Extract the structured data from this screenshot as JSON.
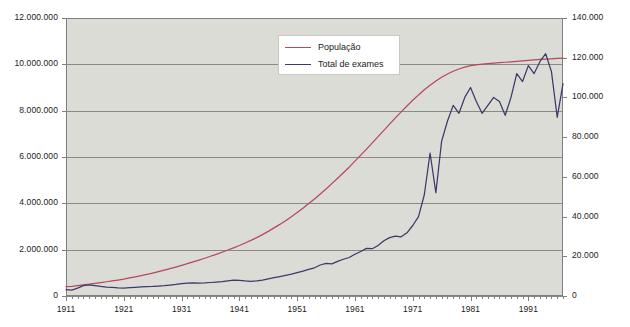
{
  "chart_data": {
    "type": "line",
    "title": "",
    "subtitle": "",
    "xlabel": "",
    "ylabel": "",
    "ylabel_right": "",
    "grid": true,
    "legend_position": "top-center",
    "background_plot_color": "#dcdcd6",
    "background_page_color": "#ffffff",
    "axis_color": "#808080",
    "gridline_color": "#8a8a84",
    "x": [
      1911,
      1912,
      1913,
      1914,
      1915,
      1916,
      1917,
      1918,
      1919,
      1920,
      1921,
      1922,
      1923,
      1924,
      1925,
      1926,
      1927,
      1928,
      1929,
      1930,
      1931,
      1932,
      1933,
      1934,
      1935,
      1936,
      1937,
      1938,
      1939,
      1940,
      1941,
      1942,
      1943,
      1944,
      1945,
      1946,
      1947,
      1948,
      1949,
      1950,
      1951,
      1952,
      1953,
      1954,
      1955,
      1956,
      1957,
      1958,
      1959,
      1960,
      1961,
      1962,
      1963,
      1964,
      1965,
      1966,
      1967,
      1968,
      1969,
      1970,
      1971,
      1972,
      1973,
      1974,
      1975,
      1976,
      1977,
      1978,
      1979,
      1980,
      1981,
      1982,
      1983,
      1984,
      1985,
      1986,
      1987,
      1988,
      1989,
      1990,
      1991,
      1992,
      1993,
      1994,
      1995,
      1996,
      1997
    ],
    "xlim": [
      1911,
      1997
    ],
    "xticks": [
      1911,
      1921,
      1931,
      1941,
      1951,
      1961,
      1971,
      1981,
      1991
    ],
    "xtick_labels": [
      "1911",
      "1921",
      "1931",
      "1941",
      "1951",
      "1961",
      "1971",
      "1981",
      "1991"
    ],
    "x_minor_ticks_every": 1,
    "yticks_left": [
      0,
      2000000,
      4000000,
      6000000,
      8000000,
      10000000,
      12000000
    ],
    "ytick_labels_left": [
      "0",
      "2.000.000",
      "4.000.000",
      "6.000.000",
      "8.000.000",
      "10.000.000",
      "12.000.000"
    ],
    "ylim_left": [
      0,
      12000000
    ],
    "yticks_right": [
      0,
      20000,
      40000,
      60000,
      80000,
      100000,
      120000,
      140000
    ],
    "ytick_labels_right": [
      "0",
      "20.000",
      "40.000",
      "60.000",
      "80.000",
      "100.000",
      "120.000",
      "140.000"
    ],
    "ylim_right": [
      0,
      140000
    ],
    "series": [
      {
        "name": "População",
        "label": "População",
        "axis": "left",
        "color": "#b5485c",
        "values": [
          400000,
          420000,
          450000,
          480000,
          510000,
          545000,
          580000,
          615000,
          650000,
          690000,
          730000,
          780000,
          830000,
          880000,
          935000,
          990000,
          1050000,
          1115000,
          1180000,
          1250000,
          1320000,
          1395000,
          1470000,
          1550000,
          1630000,
          1715000,
          1800000,
          1890000,
          1985000,
          2080000,
          2180000,
          2290000,
          2400000,
          2520000,
          2650000,
          2790000,
          2940000,
          3090000,
          3250000,
          3420000,
          3600000,
          3790000,
          3990000,
          4190000,
          4400000,
          4620000,
          4850000,
          5080000,
          5320000,
          5560000,
          5820000,
          6080000,
          6340000,
          6610000,
          6880000,
          7150000,
          7420000,
          7690000,
          7950000,
          8200000,
          8450000,
          8680000,
          8900000,
          9100000,
          9280000,
          9440000,
          9580000,
          9700000,
          9800000,
          9880000,
          9940000,
          9980000,
          10010000,
          10030000,
          10050000,
          10070000,
          10090000,
          10110000,
          10130000,
          10150000,
          10170000,
          10190000,
          10210000,
          10225000,
          10240000,
          10255000,
          10270000
        ]
      },
      {
        "name": "Total de exames",
        "label": "Total de exames",
        "axis": "right",
        "color": "#3a3a6b",
        "values": [
          3200,
          3000,
          4000,
          5200,
          5600,
          5200,
          4800,
          4500,
          4300,
          4100,
          4000,
          4200,
          4400,
          4600,
          4700,
          4800,
          5000,
          5200,
          5500,
          5800,
          6200,
          6500,
          6600,
          6500,
          6600,
          6800,
          7000,
          7200,
          7600,
          8000,
          7900,
          7600,
          7400,
          7600,
          8000,
          8600,
          9200,
          9800,
          10400,
          11000,
          11800,
          12500,
          13400,
          14200,
          15600,
          16400,
          16200,
          17400,
          18500,
          19400,
          21000,
          22400,
          24000,
          23800,
          25400,
          27800,
          29400,
          30200,
          29800,
          31800,
          35500,
          40000,
          51000,
          72000,
          52000,
          78000,
          88000,
          96000,
          92000,
          100000,
          105000,
          98000,
          92000,
          96000,
          100000,
          98000,
          91000,
          100000,
          112000,
          108000,
          116000,
          112000,
          118000,
          122000,
          113000,
          90000,
          107000
        ]
      }
    ]
  },
  "legend": {
    "items": [
      {
        "label": "População",
        "color": "#b5485c"
      },
      {
        "label": "Total de exames",
        "color": "#3a3a6b"
      }
    ]
  }
}
